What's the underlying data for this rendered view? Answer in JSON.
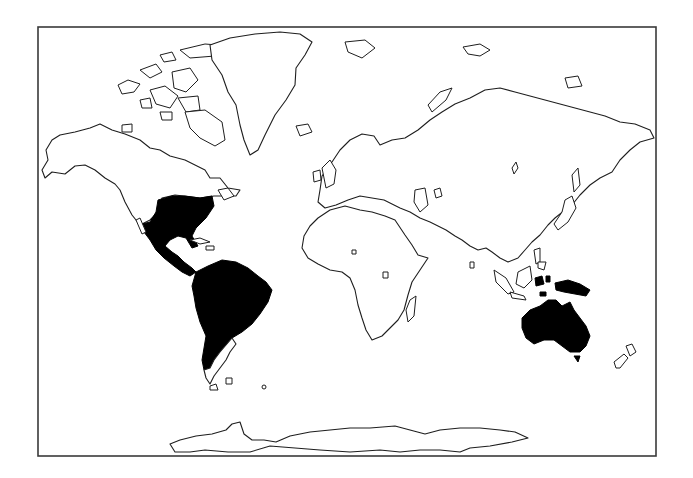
{
  "map": {
    "type": "world-outline-map",
    "projection": "cylindrical (Miller-like)",
    "frame": {
      "x": 38,
      "y": 27,
      "width": 618,
      "height": 429
    },
    "colors": {
      "background": "#ffffff",
      "land": "#ffffff",
      "coastline": "#1e1e1e",
      "highlighted": "#000000",
      "frame": "#3a3a3a"
    },
    "highlighted_regions": [
      {
        "name": "Southern United States / Mexico / Central America",
        "fill": "#000000"
      },
      {
        "name": "South America (excluding Patagonia)",
        "fill": "#000000"
      },
      {
        "name": "Australia",
        "fill": "#000000"
      },
      {
        "name": "New Guinea",
        "fill": "#000000"
      },
      {
        "name": "Tasmania",
        "fill": "#000000"
      }
    ],
    "outlined_regions": [
      "North America (north)",
      "Arctic Archipelago",
      "Greenland",
      "Iceland",
      "Europe",
      "Africa",
      "Madagascar",
      "Asia",
      "Japan",
      "Indonesia",
      "New Zealand",
      "Antarctica",
      "Patagonia",
      "Svalbard",
      "Novaya Zemlya"
    ],
    "labels": []
  }
}
